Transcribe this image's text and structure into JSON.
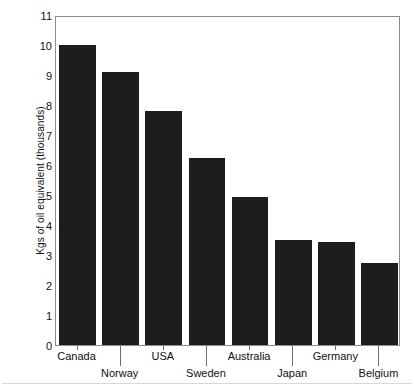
{
  "chart_data": {
    "type": "bar",
    "title": "",
    "xlabel": "",
    "ylabel": "Kgs of oil equivalent (thousands)",
    "categories": [
      "Canada",
      "Norway",
      "USA",
      "Sweden",
      "Australia",
      "Japan",
      "Germany",
      "Belgium"
    ],
    "values": [
      10.0,
      9.1,
      7.8,
      6.25,
      4.95,
      3.5,
      3.45,
      2.75
    ],
    "ylim": [
      0,
      11
    ],
    "ytick_labels": [
      "0",
      "1",
      "2",
      "3",
      "4",
      "5",
      "6",
      "7",
      "8",
      "9",
      "10",
      "11"
    ],
    "ytick_values": [
      0,
      1,
      2,
      3,
      4,
      5,
      6,
      7,
      8,
      9,
      10,
      11
    ],
    "grid": false,
    "legend": false,
    "bar_color": "#1c1c1c",
    "axis_color": "#8c8c8c",
    "label_rows": [
      0,
      1,
      0,
      1,
      0,
      1,
      0,
      1
    ]
  }
}
